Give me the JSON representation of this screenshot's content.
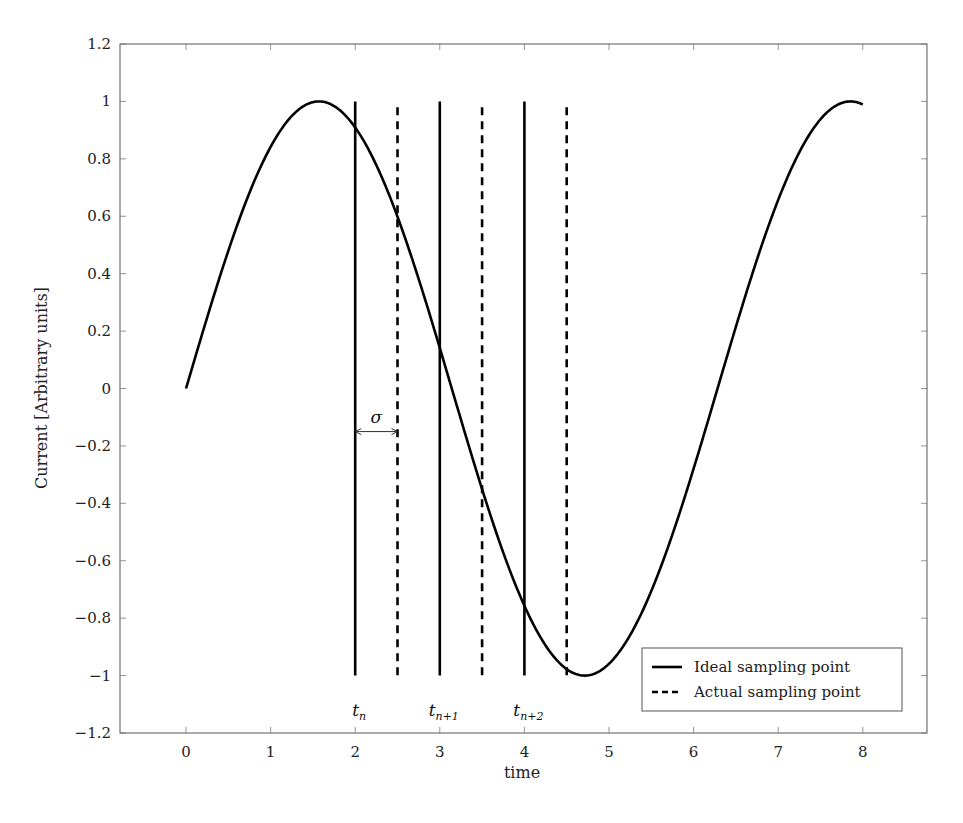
{
  "chart_data": {
    "type": "line",
    "title": "",
    "xlabel": "time",
    "ylabel": "Current [Arbitrary units]",
    "xlim": [
      -0.8,
      8.8
    ],
    "ylim": [
      -1.2,
      1.2
    ],
    "x_ticks": [
      0,
      1,
      2,
      3,
      4,
      5,
      6,
      7,
      8
    ],
    "y_ticks": [
      -1.2,
      -1,
      -0.8,
      -0.6,
      -0.4,
      -0.2,
      0,
      0.2,
      0.4,
      0.6,
      0.8,
      1,
      1.2
    ],
    "x_tick_labels": [
      "0",
      "1",
      "2",
      "3",
      "4",
      "5",
      "6",
      "7",
      "8"
    ],
    "y_tick_labels": [
      "−1.2",
      "−1",
      "−0.8",
      "−0.6",
      "−0.4",
      "−0.2",
      "0",
      "0.2",
      "0.4",
      "0.6",
      "0.8",
      "1",
      "1.2"
    ],
    "grid": false,
    "series": [
      {
        "name": "signal",
        "function": "sin(t)",
        "x_range": [
          0,
          8
        ],
        "style": "solid",
        "color": "#000000",
        "x": [
          0,
          0.5,
          1,
          1.5,
          1.57,
          2,
          2.5,
          3,
          3.5,
          4,
          4.5,
          4.71,
          5,
          5.5,
          6,
          6.5,
          7,
          7.5,
          7.85,
          8
        ],
        "values": [
          0,
          0.48,
          0.84,
          1.0,
          1.0,
          0.91,
          0.6,
          0.14,
          -0.35,
          -0.76,
          -0.98,
          -1.0,
          -0.96,
          -0.71,
          -0.28,
          0.22,
          0.66,
          0.94,
          1.0,
          0.99
        ]
      }
    ],
    "vertical_lines": [
      {
        "name": "Ideal sampling point",
        "style": "solid",
        "x": [
          2,
          3,
          4
        ],
        "y_from": -1,
        "y_to": 1
      },
      {
        "name": "Actual sampling point",
        "style": "dashed",
        "x": [
          2.5,
          3.5,
          4.5
        ],
        "y_from": -1,
        "y_to": 0.98
      }
    ],
    "annotations": [
      {
        "text": "σ",
        "type": "double-arrow",
        "x_from": 2,
        "x_to": 2.5,
        "y": -0.15
      },
      {
        "text": "t",
        "sub": "n",
        "x": 2,
        "y": -1.12
      },
      {
        "text": "t",
        "sub": "n+1",
        "x": 3,
        "y": -1.12
      },
      {
        "text": "t",
        "sub": "n+2",
        "x": 4,
        "y": -1.12
      }
    ],
    "legend": {
      "position": "lower right",
      "entries": [
        {
          "label": "Ideal sampling point",
          "style": "solid"
        },
        {
          "label": "Actual sampling point",
          "style": "dashed"
        }
      ]
    }
  },
  "caption_partial": "(caption text cut off at bottom of image)"
}
